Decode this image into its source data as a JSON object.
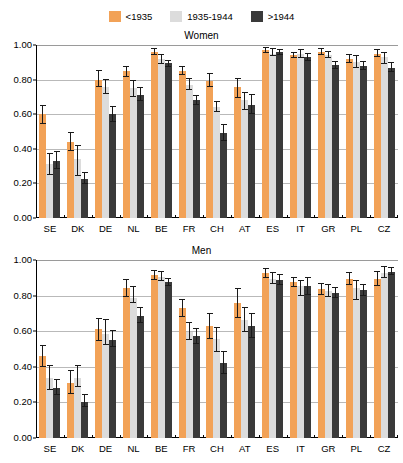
{
  "legend": {
    "entries": [
      {
        "label": "<1935",
        "color": "#F2A257",
        "icon": "legend-swatch-orange"
      },
      {
        "label": "1935-1944",
        "color": "#DCDCDC",
        "icon": "legend-swatch-lightgray"
      },
      {
        "label": ">1944",
        "color": "#3A3A3A",
        "icon": "legend-swatch-darkgray"
      }
    ]
  },
  "chart_data": [
    {
      "type": "bar",
      "title": "Women",
      "xlabel": "",
      "ylabel": "",
      "ylim": [
        0,
        1.0
      ],
      "yticks": [
        "0.00",
        "0.20",
        "0.40",
        "0.60",
        "0.80",
        "1.00"
      ],
      "ytick_values": [
        0.0,
        0.2,
        0.4,
        0.6,
        0.8,
        1.0
      ],
      "grid": true,
      "legend_position": "top-center",
      "categories": [
        "SE",
        "DK",
        "DE",
        "NL",
        "BE",
        "FR",
        "CH",
        "AT",
        "ES",
        "IT",
        "GR",
        "PL",
        "CZ"
      ],
      "series": [
        {
          "name": "<1935",
          "color": "#F2A257",
          "values": [
            0.6,
            0.44,
            0.8,
            0.85,
            0.96,
            0.85,
            0.79,
            0.76,
            0.97,
            0.94,
            0.96,
            0.92,
            0.95
          ],
          "err_low": [
            0.545,
            0.385,
            0.755,
            0.815,
            0.945,
            0.825,
            0.755,
            0.695,
            0.955,
            0.925,
            0.945,
            0.895,
            0.93
          ],
          "err_high": [
            0.655,
            0.495,
            0.855,
            0.88,
            0.98,
            0.88,
            0.84,
            0.81,
            0.99,
            0.96,
            0.985,
            0.95,
            0.975
          ]
        },
        {
          "name": "1935-1944",
          "color": "#DCDCDC",
          "values": [
            0.31,
            0.34,
            0.76,
            0.75,
            0.92,
            0.77,
            0.64,
            0.68,
            0.95,
            0.95,
            0.94,
            0.9,
            0.93
          ],
          "err_low": [
            0.25,
            0.245,
            0.715,
            0.7,
            0.89,
            0.74,
            0.61,
            0.625,
            0.935,
            0.925,
            0.925,
            0.87,
            0.89
          ],
          "err_high": [
            0.375,
            0.425,
            0.805,
            0.8,
            0.95,
            0.81,
            0.675,
            0.73,
            0.98,
            0.975,
            0.965,
            0.94,
            0.96
          ]
        },
        {
          "name": ">1944",
          "color": "#3A3A3A",
          "values": [
            0.33,
            0.225,
            0.6,
            0.71,
            0.895,
            0.68,
            0.49,
            0.655,
            0.96,
            0.93,
            0.885,
            0.88,
            0.87
          ],
          "err_low": [
            0.285,
            0.195,
            0.555,
            0.675,
            0.875,
            0.655,
            0.445,
            0.6,
            0.945,
            0.905,
            0.86,
            0.855,
            0.845
          ],
          "err_high": [
            0.385,
            0.265,
            0.645,
            0.755,
            0.915,
            0.71,
            0.545,
            0.715,
            0.975,
            0.955,
            0.91,
            0.905,
            0.9
          ]
        }
      ]
    },
    {
      "type": "bar",
      "title": "Men",
      "xlabel": "",
      "ylabel": "",
      "ylim": [
        0,
        1.0
      ],
      "yticks": [
        "0.00",
        "0.20",
        "0.40",
        "0.60",
        "0.80",
        "1.00"
      ],
      "ytick_values": [
        0.0,
        0.2,
        0.4,
        0.6,
        0.8,
        1.0
      ],
      "grid": true,
      "legend_position": "top-center",
      "categories": [
        "SE",
        "DK",
        "DE",
        "NL",
        "BE",
        "FR",
        "CH",
        "AT",
        "ES",
        "IT",
        "GR",
        "PL",
        "CZ"
      ],
      "series": [
        {
          "name": "<1935",
          "color": "#F2A257",
          "values": [
            0.46,
            0.31,
            0.61,
            0.845,
            0.915,
            0.73,
            0.63,
            0.76,
            0.925,
            0.875,
            0.835,
            0.895,
            0.895
          ],
          "err_low": [
            0.4,
            0.25,
            0.545,
            0.79,
            0.89,
            0.68,
            0.555,
            0.675,
            0.9,
            0.85,
            0.805,
            0.86,
            0.855
          ],
          "err_high": [
            0.52,
            0.38,
            0.675,
            0.895,
            0.945,
            0.78,
            0.705,
            0.845,
            0.955,
            0.905,
            0.87,
            0.935,
            0.94
          ]
        },
        {
          "name": "1935-1944",
          "color": "#DCDCDC",
          "values": [
            0.335,
            0.335,
            0.585,
            0.785,
            0.905,
            0.595,
            0.555,
            0.665,
            0.895,
            0.855,
            0.825,
            0.845,
            0.925
          ],
          "err_low": [
            0.27,
            0.285,
            0.52,
            0.76,
            0.88,
            0.55,
            0.485,
            0.595,
            0.865,
            0.8,
            0.79,
            0.775,
            0.9
          ],
          "err_high": [
            0.41,
            0.41,
            0.67,
            0.855,
            0.94,
            0.65,
            0.625,
            0.735,
            0.93,
            0.89,
            0.865,
            0.89,
            0.965
          ]
        },
        {
          "name": ">1944",
          "color": "#3A3A3A",
          "values": [
            0.28,
            0.2,
            0.55,
            0.685,
            0.875,
            0.575,
            0.42,
            0.63,
            0.89,
            0.855,
            0.815,
            0.83,
            0.935
          ],
          "err_low": [
            0.24,
            0.175,
            0.51,
            0.645,
            0.855,
            0.53,
            0.36,
            0.56,
            0.86,
            0.805,
            0.785,
            0.8,
            0.915
          ],
          "err_high": [
            0.33,
            0.245,
            0.605,
            0.735,
            0.9,
            0.62,
            0.49,
            0.7,
            0.92,
            0.905,
            0.85,
            0.865,
            0.96
          ]
        }
      ]
    }
  ]
}
